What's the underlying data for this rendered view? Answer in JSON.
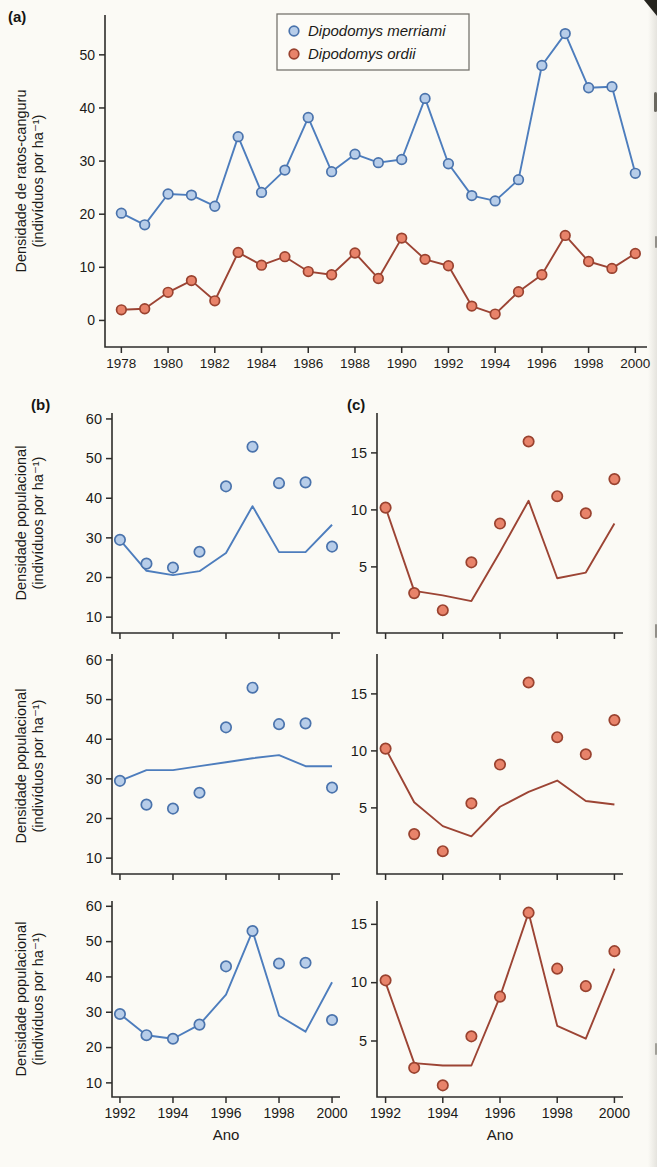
{
  "labels": {
    "panel_a": "(a)",
    "panel_b": "(b)",
    "panel_c": "(c)",
    "ylabel_a1": "Densidade de ratos-canguru",
    "ylabel_a2": "(indivíduos por ha⁻¹)",
    "ylabel_b1": "Densidade populacional",
    "ylabel_b2": "(indivíduos por ha⁻¹)",
    "xlabel": "Ano"
  },
  "colors": {
    "blue": {
      "line": "#4d7dbd",
      "fill": "#b7cde9",
      "stroke": "#4a73ac"
    },
    "red": {
      "line": "#9c4434",
      "fill": "#e8836a",
      "stroke": "#99422f"
    },
    "axis": "#2e2d2b",
    "text": "#1b1a18",
    "legend_border": "#77756f",
    "legend_bg": "#fcfbf7"
  },
  "chart_data": [
    {
      "id": "a",
      "type": "line",
      "title": "",
      "xlabel": "",
      "ylabel": "Densidade de ratos-canguru (indivíduos por ha⁻¹)",
      "x": [
        1978,
        1979,
        1980,
        1981,
        1982,
        1983,
        1984,
        1985,
        1986,
        1987,
        1988,
        1989,
        1990,
        1991,
        1992,
        1993,
        1994,
        1995,
        1996,
        1997,
        1998,
        1999,
        2000
      ],
      "xlim": [
        1977.3,
        2000.5
      ],
      "ylim": [
        -5,
        57.5
      ],
      "xticks": [
        1978,
        1980,
        1982,
        1984,
        1986,
        1988,
        1990,
        1992,
        1994,
        1996,
        1998,
        2000
      ],
      "yticks": [
        0,
        10,
        20,
        30,
        40,
        50
      ],
      "show_xlabels": true,
      "legend": true,
      "series": [
        {
          "name": "Dipodomys merriami",
          "style": "line+markers",
          "color_key": "blue",
          "values": [
            20.2,
            18,
            23.8,
            23.6,
            21.5,
            34.6,
            24.1,
            28.3,
            38.2,
            28,
            31.3,
            29.7,
            30.3,
            41.8,
            29.5,
            23.5,
            22.5,
            26.5,
            48,
            54,
            43.8,
            44,
            27.7
          ]
        },
        {
          "name": "Dipodomys ordii",
          "style": "line+markers",
          "color_key": "red",
          "values": [
            2,
            2.2,
            5.3,
            7.5,
            3.7,
            12.8,
            10.4,
            12,
            9.2,
            8.6,
            12.7,
            7.9,
            15.5,
            11.5,
            10.3,
            2.7,
            1.2,
            5.4,
            8.6,
            16,
            11.1,
            9.8,
            12.6
          ]
        }
      ]
    },
    {
      "id": "b1",
      "type": "scatter",
      "xlabel": "",
      "ylabel": "Densidade populacional (indivíduos por ha⁻¹)",
      "x": [
        1992,
        1993,
        1994,
        1995,
        1996,
        1997,
        1998,
        1999,
        2000
      ],
      "xlim": [
        1991.7,
        2000.3
      ],
      "ylim": [
        6,
        61.5
      ],
      "xticks": [
        1992,
        1994,
        1996,
        1998,
        2000
      ],
      "yticks": [
        10,
        20,
        30,
        40,
        50,
        60
      ],
      "show_xlabels": false,
      "series": [
        {
          "name": "modelo",
          "style": "line",
          "color_key": "blue",
          "values": [
            29.5,
            21.7,
            20.6,
            21.6,
            26.2,
            38,
            26.4,
            26.4,
            33.3
          ]
        },
        {
          "name": "observado",
          "style": "markers",
          "color_key": "blue",
          "values": [
            29.5,
            23.5,
            22.5,
            26.5,
            43,
            53,
            43.8,
            44,
            27.8
          ]
        }
      ]
    },
    {
      "id": "b2",
      "type": "scatter",
      "xlabel": "",
      "ylabel": "Densidade populacional (indivíduos por ha⁻¹)",
      "x": [
        1992,
        1993,
        1994,
        1995,
        1996,
        1997,
        1998,
        1999,
        2000
      ],
      "xlim": [
        1991.7,
        2000.3
      ],
      "ylim": [
        6,
        61.5
      ],
      "xticks": [
        1992,
        1994,
        1996,
        1998,
        2000
      ],
      "yticks": [
        10,
        20,
        30,
        40,
        50,
        60
      ],
      "show_xlabels": false,
      "series": [
        {
          "name": "modelo",
          "style": "line",
          "color_key": "blue",
          "values": [
            29.5,
            32.2,
            32.2,
            33.2,
            34.2,
            35.2,
            36,
            33.2,
            33.2
          ]
        },
        {
          "name": "observado",
          "style": "markers",
          "color_key": "blue",
          "values": [
            29.5,
            23.5,
            22.5,
            26.5,
            43,
            53,
            43.8,
            44,
            27.8
          ]
        }
      ]
    },
    {
      "id": "b3",
      "type": "scatter",
      "xlabel": "Ano",
      "ylabel": "Densidade populacional (indivíduos por ha⁻¹)",
      "x": [
        1992,
        1993,
        1994,
        1995,
        1996,
        1997,
        1998,
        1999,
        2000
      ],
      "xlim": [
        1991.7,
        2000.3
      ],
      "ylim": [
        6,
        61.5
      ],
      "xticks": [
        1992,
        1994,
        1996,
        1998,
        2000
      ],
      "yticks": [
        10,
        20,
        30,
        40,
        50,
        60
      ],
      "show_xlabels": true,
      "series": [
        {
          "name": "modelo",
          "style": "line",
          "color_key": "blue",
          "values": [
            29.5,
            23.5,
            22.5,
            26.5,
            35,
            53,
            29,
            24.5,
            38.5
          ]
        },
        {
          "name": "observado",
          "style": "markers",
          "color_key": "blue",
          "values": [
            29.5,
            23.5,
            22.5,
            26.5,
            43,
            53,
            43.8,
            44,
            27.8
          ]
        }
      ]
    },
    {
      "id": "c1",
      "type": "scatter",
      "xlabel": "",
      "ylabel": "",
      "x": [
        1992,
        1993,
        1994,
        1995,
        1996,
        1997,
        1998,
        1999,
        2000
      ],
      "xlim": [
        1991.7,
        2000.3
      ],
      "ylim": [
        -0.8,
        18.5
      ],
      "xticks": [
        1992,
        1994,
        1996,
        1998,
        2000
      ],
      "yticks": [
        5,
        10,
        15
      ],
      "show_xlabels": false,
      "series": [
        {
          "name": "modelo",
          "style": "line",
          "color_key": "red",
          "values": [
            10.2,
            2.9,
            2.5,
            2,
            6.3,
            10.8,
            4,
            4.5,
            8.8
          ]
        },
        {
          "name": "observado",
          "style": "markers",
          "color_key": "red",
          "values": [
            10.2,
            2.7,
            1.2,
            5.4,
            8.8,
            16,
            11.2,
            9.7,
            12.7
          ]
        }
      ]
    },
    {
      "id": "c2",
      "type": "scatter",
      "xlabel": "",
      "ylabel": "",
      "x": [
        1992,
        1993,
        1994,
        1995,
        1996,
        1997,
        1998,
        1999,
        2000
      ],
      "xlim": [
        1991.7,
        2000.3
      ],
      "ylim": [
        -0.8,
        18.5
      ],
      "xticks": [
        1992,
        1994,
        1996,
        1998,
        2000
      ],
      "yticks": [
        5,
        10,
        15
      ],
      "show_xlabels": false,
      "series": [
        {
          "name": "modelo",
          "style": "line",
          "color_key": "red",
          "values": [
            10.2,
            5.5,
            3.4,
            2.5,
            5.1,
            6.4,
            7.4,
            5.6,
            5.3
          ]
        },
        {
          "name": "observado",
          "style": "markers",
          "color_key": "red",
          "values": [
            10.2,
            2.7,
            1.2,
            5.4,
            8.8,
            16,
            11.2,
            9.7,
            12.7
          ]
        }
      ]
    },
    {
      "id": "c3",
      "type": "scatter",
      "xlabel": "Ano",
      "ylabel": "",
      "x": [
        1992,
        1993,
        1994,
        1995,
        1996,
        1997,
        1998,
        1999,
        2000
      ],
      "xlim": [
        1991.7,
        2000.3
      ],
      "ylim": [
        0.2,
        17
      ],
      "xticks": [
        1992,
        1994,
        1996,
        1998,
        2000
      ],
      "yticks": [
        5,
        10,
        15
      ],
      "show_xlabels": true,
      "series": [
        {
          "name": "modelo",
          "style": "line",
          "color_key": "red",
          "values": [
            10,
            3.1,
            2.9,
            2.9,
            8.8,
            16,
            6.3,
            5.2,
            11.2
          ]
        },
        {
          "name": "observado",
          "style": "markers",
          "color_key": "red",
          "values": [
            10.2,
            2.7,
            1.2,
            5.4,
            8.8,
            16,
            11.2,
            9.7,
            12.7
          ]
        }
      ]
    }
  ]
}
